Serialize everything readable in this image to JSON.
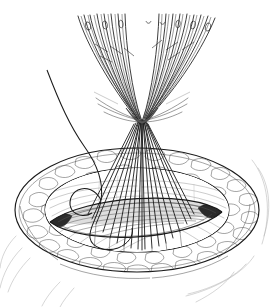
{
  "document": {
    "title": "Surgical Closure Illustration",
    "medium": "pen-and-ink line drawing",
    "background_color": "#ffffff",
    "ink_color": "#1a1a1a",
    "width": 275,
    "height": 307,
    "caption": "",
    "labels": []
  },
  "scene": {
    "subject": "oval surgical wound with fanned suture needles held in traction",
    "view": "three-quarter oblique from above",
    "parts": [
      {
        "name": "needle-fan",
        "label": "Curved suture needles fanned above the field"
      },
      {
        "name": "suture-bundle-knot",
        "label": "Sutures gathered at a convergence point"
      },
      {
        "name": "suture-strands",
        "label": "Parallel suture strands descending to the wound"
      },
      {
        "name": "free-suture-loop",
        "label": "Single curved suture running from upper left"
      },
      {
        "name": "wound-oval",
        "label": "Everted oval wound with cobblestone tissue rim"
      },
      {
        "name": "incision-lips",
        "label": "Lens-shaped incision opening"
      },
      {
        "name": "skin-contours",
        "label": "Radiating skin contour lines"
      }
    ]
  },
  "geometry": {
    "needle_fan": {
      "count": 16,
      "top_y": 14,
      "converge_point": {
        "x": 141,
        "y": 120
      },
      "spread_left_x": 74,
      "spread_right_x": 222
    },
    "suture_strands": {
      "count": 19,
      "top_y": 118,
      "bottom_y": 262,
      "left_x": 94,
      "right_x": 200
    },
    "wound_oval": {
      "cx": 137,
      "cy": 210,
      "outer_rx": 122,
      "outer_ry": 62,
      "inner_rx": 92,
      "inner_ry": 42
    },
    "incision": {
      "left_tip": {
        "x": 50,
        "y": 222
      },
      "right_tip": {
        "x": 222,
        "y": 212
      },
      "mid_y": 218
    },
    "free_suture": {
      "start": {
        "x": 47,
        "y": 70
      },
      "end": {
        "x": 120,
        "y": 248
      }
    }
  },
  "palette": {
    "ink": "#1a1a1a",
    "ink_soft": "#4a4a4a",
    "ink_pale": "#8e8e8e",
    "ink_faint": "#b4b4b4",
    "shadow": "#2b2b2b",
    "tone_mid": "#cfcfcf",
    "tone_light": "#ededed",
    "paper": "#ffffff"
  }
}
